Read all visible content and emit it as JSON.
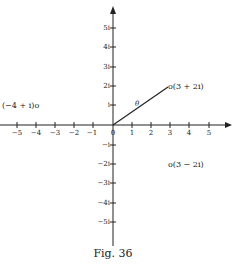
{
  "figure": {
    "caption": "Fig. 36",
    "origin_label": "0",
    "x_ticks": [
      {
        "value": -5,
        "label": "−5"
      },
      {
        "value": -4,
        "label": "−4"
      },
      {
        "value": -3,
        "label": "−3"
      },
      {
        "value": -2,
        "label": "−2"
      },
      {
        "value": -1,
        "label": "−1"
      },
      {
        "value": 1,
        "label": "1"
      },
      {
        "value": 2,
        "label": "2"
      },
      {
        "value": 3,
        "label": "3"
      },
      {
        "value": 4,
        "label": "4"
      },
      {
        "value": 5,
        "label": "5"
      }
    ],
    "y_ticks": [
      {
        "value": 5,
        "label": "5i"
      },
      {
        "value": 4,
        "label": "4i"
      },
      {
        "value": 3,
        "label": "3i"
      },
      {
        "value": 2,
        "label": "2i"
      },
      {
        "value": 1,
        "label": "i"
      },
      {
        "value": -1,
        "label": "−i"
      },
      {
        "value": -2,
        "label": "−2i"
      },
      {
        "value": -3,
        "label": "−3i"
      },
      {
        "value": -4,
        "label": "−4i"
      },
      {
        "value": -5,
        "label": "−5i"
      }
    ],
    "points": [
      {
        "re": 3,
        "im": 2,
        "label": "o(3 + 2i)"
      },
      {
        "re": -4,
        "im": 1,
        "label": "(−4 + i)o"
      },
      {
        "re": 3,
        "im": -2,
        "label": "o(3 − 2i)"
      }
    ],
    "vector": {
      "from": [
        0,
        0
      ],
      "to": [
        3,
        2
      ],
      "angle_label": "θ"
    },
    "colors": {
      "ink": "#222222",
      "background": "#ffffff"
    }
  }
}
